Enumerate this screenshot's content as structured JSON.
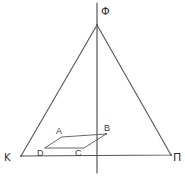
{
  "figure": {
    "background_color": "#ffffff",
    "line_color": "#555555",
    "label_color": "#3a3a3a",
    "width": 185,
    "height": 176
  },
  "labels": {
    "apex": "Φ",
    "bottom_left": "Κ",
    "bottom_right": "Π",
    "inner_a": "A",
    "inner_b": "B",
    "inner_c": "C",
    "inner_d": "D"
  },
  "geometry": {
    "triangle": {
      "apex": [
        97,
        25
      ],
      "bottom_left": [
        21,
        156
      ],
      "bottom_right": [
        171,
        155
      ],
      "points": "97,25 21,156 171,155"
    },
    "axis": {
      "x1": 97,
      "y1": 3,
      "x2": 97,
      "y2": 173,
      "description": "vertical axis of symmetry through apex"
    },
    "quad": {
      "a": [
        62,
        137
      ],
      "b": [
        106,
        134
      ],
      "c": [
        84,
        148
      ],
      "d": [
        45,
        148
      ],
      "points": "62,137 106,134 84,148 45,148"
    }
  },
  "label_positions": {
    "apex": [
      101,
      15
    ],
    "bottom_left": [
      5,
      160
    ],
    "bottom_right": [
      174,
      160
    ],
    "inner_a": [
      57,
      133
    ],
    "inner_b": [
      105,
      130
    ],
    "inner_c": [
      76,
      155
    ],
    "inner_d": [
      38,
      155
    ]
  }
}
